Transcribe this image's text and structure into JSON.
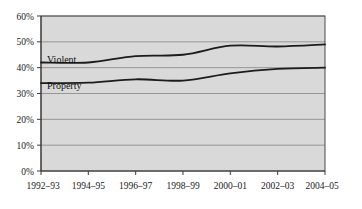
{
  "chart_data": {
    "type": "line",
    "title": "",
    "subtitle": "",
    "xlabel": "",
    "ylabel": "",
    "grid": true,
    "legend_position": "inline-labels",
    "ylim": [
      0,
      60
    ],
    "ytick_labels": [
      "60%",
      "50%",
      "40%",
      "30%",
      "20%",
      "10%",
      "0%"
    ],
    "ytick_values": [
      60,
      50,
      40,
      30,
      20,
      10,
      0
    ],
    "categories": [
      "1992-93",
      "1994-95",
      "1996-97",
      "1998-99",
      "2000-01",
      "2002-03",
      "2004-05"
    ],
    "xtick_labels": [
      "1992–93",
      "1994–95",
      "1996–97",
      "1998–99",
      "2000–01",
      "2002–03",
      "2004–05"
    ],
    "series": [
      {
        "name": "Violent",
        "label": "Violent",
        "color": "#1c1c1c",
        "values": [
          42.0,
          42.0,
          44.5,
          45.0,
          48.5,
          48.2,
          49.0
        ]
      },
      {
        "name": "Property",
        "label": "Property",
        "color": "#1c1c1c",
        "values": [
          34.0,
          34.2,
          35.5,
          35.0,
          37.8,
          39.5,
          40.0
        ]
      }
    ]
  },
  "colors": {
    "plot_background": "#d9d9d9",
    "page_background": "#ffffff",
    "gridline": "#8e8e8e",
    "axis": "#3a3a3a",
    "line": "#1c1c1c",
    "text": "#1a1a1a"
  },
  "annotations": {
    "violent_label": "Violent",
    "property_label": "Property"
  }
}
